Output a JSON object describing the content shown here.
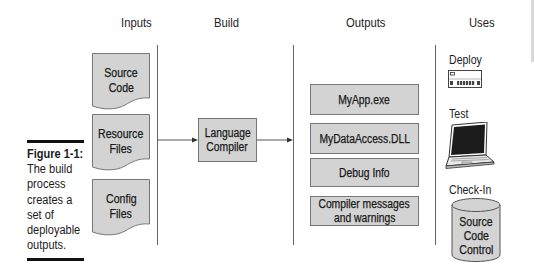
{
  "columns": {
    "inputs": "Inputs",
    "build": "Build",
    "outputs": "Outputs",
    "uses": "Uses"
  },
  "caption": {
    "figure_label": "Figure 1-1:",
    "lines": [
      "The build",
      "process",
      "creates a",
      "set of",
      "deployable",
      "outputs."
    ]
  },
  "inputs": [
    {
      "line1": "Source",
      "line2": "Code"
    },
    {
      "line1": "Resource",
      "line2": "Files"
    },
    {
      "line1": "Config",
      "line2": "Files"
    }
  ],
  "build": {
    "line1": "Language",
    "line2": "Compiler"
  },
  "outputs": [
    {
      "line1": "MyApp.exe"
    },
    {
      "line1": "MyDataAccess.DLL"
    },
    {
      "line1": "Debug Info"
    },
    {
      "line1": "Compiler messages",
      "line2": "and warnings"
    }
  ],
  "uses": {
    "deploy": {
      "label": "Deploy",
      "icon": "server-rack-icon"
    },
    "test": {
      "label": "Test",
      "icon": "laptop-icon"
    },
    "checkin": {
      "label": "Check-In",
      "icon": "database-cylinder-icon",
      "line1": "Source",
      "line2": "Code",
      "line3": "Control"
    }
  },
  "colors": {
    "box_fill": "#d3d3d3",
    "box_border": "#777777",
    "line": "#666666",
    "rule": "#111111"
  }
}
